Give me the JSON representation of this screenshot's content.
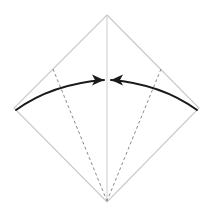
{
  "diagram": {
    "type": "origami-fold-instruction",
    "background_color": "#ffffff",
    "canvas": {
      "width": 212,
      "height": 215
    },
    "paper": {
      "shape_name": "diamond-square",
      "edge_color": "#c8c8c8",
      "edge_width": 1.1,
      "fill_color": "#ffffff",
      "vertices": {
        "top": {
          "x": 107,
          "y": 15
        },
        "right": {
          "x": 199,
          "y": 108
        },
        "bottom": {
          "x": 107,
          "y": 202
        },
        "left": {
          "x": 14,
          "y": 108
        }
      },
      "outline_path": "M 107 15 L 199 108 L 107 202 L 14 108 Z"
    },
    "center_line": {
      "name": "vertical-center-crease",
      "style": "solid",
      "color": "#cfcfcf",
      "width": 1.1,
      "from": {
        "x": 107,
        "y": 16
      },
      "to": {
        "x": 107,
        "y": 201
      }
    },
    "fold_lines": [
      {
        "name": "left-dashed-fold-line",
        "style": "dashed",
        "color": "#8a8a8a",
        "width": 1,
        "dash_pattern": "3,2.6",
        "from": {
          "x": 53,
          "y": 69
        },
        "to": {
          "x": 107,
          "y": 201
        }
      },
      {
        "name": "right-dashed-fold-line",
        "style": "dashed",
        "color": "#8a8a8a",
        "width": 1,
        "dash_pattern": "3,2.6",
        "from": {
          "x": 161,
          "y": 69
        },
        "to": {
          "x": 107,
          "y": 201
        }
      }
    ],
    "arrows": [
      {
        "name": "left-fold-arrow",
        "direction": "left-to-right",
        "color": "#1a1a1a",
        "width": 2,
        "tail": {
          "x": 16,
          "y": 110
        },
        "tip": {
          "x": 104,
          "y": 80
        },
        "control": {
          "x": 52,
          "y": 84
        },
        "curve_path": "M 16 110 Q 52 84 104 80",
        "head_points": "104,80 92,74.5 95,80 92,85.5"
      },
      {
        "name": "right-fold-arrow",
        "direction": "right-to-left",
        "color": "#1a1a1a",
        "width": 2,
        "tail": {
          "x": 197,
          "y": 110
        },
        "tip": {
          "x": 111,
          "y": 80
        },
        "control": {
          "x": 161,
          "y": 84
        },
        "curve_path": "M 197 110 Q 161 84 111 80",
        "head_points": "111,80 123,74.5 120,80 123,85.5"
      }
    ]
  }
}
